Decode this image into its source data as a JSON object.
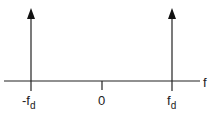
{
  "diagram": {
    "axis_label": "f",
    "ticks": [
      {
        "prefix": "-",
        "main": "f",
        "sub": "d"
      },
      {
        "main": "0"
      },
      {
        "main": "f",
        "sub": "d"
      }
    ],
    "impulses": [
      "-f_d",
      "f_d"
    ],
    "colors": {
      "line": "#222222",
      "background": "#ffffff"
    }
  }
}
